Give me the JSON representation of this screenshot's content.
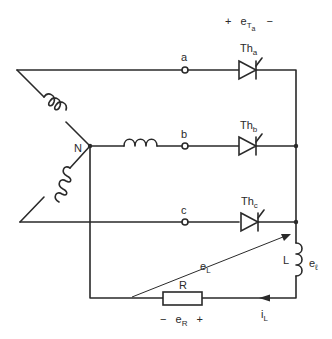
{
  "diagram": {
    "type": "three-phase half-wave controlled rectifier",
    "neutral_label": "N",
    "terminals": [
      {
        "id": "a",
        "label": "a"
      },
      {
        "id": "b",
        "label": "b"
      },
      {
        "id": "c",
        "label": "c"
      }
    ],
    "thyristors": [
      {
        "id": "Tha",
        "label": "Th",
        "subscript": "a"
      },
      {
        "id": "Thb",
        "label": "Th",
        "subscript": "b"
      },
      {
        "id": "Thc",
        "label": "Th",
        "subscript": "c"
      }
    ],
    "thyristor_voltage": {
      "plus": "+",
      "label": "e",
      "subscript": "T",
      "subsubscript": "a",
      "minus": "−"
    },
    "load_inductor": {
      "label": "L",
      "voltage_label": "e",
      "voltage_subscript": "ℓ"
    },
    "resistor": {
      "label": "R",
      "minus": "−",
      "voltage_label": "e",
      "voltage_subscript": "R",
      "plus": "+"
    },
    "load_voltage": {
      "label": "e",
      "subscript": "L"
    },
    "load_current": {
      "label": "i",
      "subscript": "L"
    },
    "colors": {
      "ink": "#2a2a2a",
      "background": "#ffffff"
    }
  }
}
